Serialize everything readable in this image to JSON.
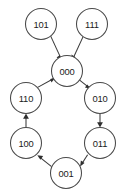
{
  "diagram": {
    "type": "directed-state-transition-graph",
    "width": 126,
    "height": 193,
    "background_color": "#ffffff",
    "node_stroke_color": "#4a4a4a",
    "node_fill_color": "#ffffff",
    "edge_color": "#3a3a3a",
    "label_color": "#1b1b1b",
    "node_radius": 15.5,
    "nodes": [
      {
        "id": "n101",
        "label": "101",
        "cx": 41,
        "cy": 24
      },
      {
        "id": "n111",
        "label": "111",
        "cx": 92,
        "cy": 24
      },
      {
        "id": "n000",
        "label": "000",
        "cx": 67,
        "cy": 71
      },
      {
        "id": "n110",
        "label": "110",
        "cx": 26,
        "cy": 98
      },
      {
        "id": "n010",
        "label": "010",
        "cx": 100,
        "cy": 98
      },
      {
        "id": "n100",
        "label": "100",
        "cx": 26,
        "cy": 143
      },
      {
        "id": "n011",
        "label": "011",
        "cx": 100,
        "cy": 143
      },
      {
        "id": "n001",
        "label": "001",
        "cx": 66,
        "cy": 173
      }
    ],
    "edges": [
      {
        "id": "e-101-000",
        "from": "101",
        "to": "000",
        "x1": 50.7,
        "y1": 36.1,
        "x2": 60.4,
        "y2": 57.2
      },
      {
        "id": "e-111-000",
        "from": "111",
        "to": "000",
        "x1": 83.1,
        "y1": 36.6,
        "x2": 73.6,
        "y2": 57.1
      },
      {
        "id": "e-000-010",
        "from": "000",
        "to": "010",
        "x1": 79.6,
        "y1": 80.2,
        "x2": 89.9,
        "y2": 88.4
      },
      {
        "id": "e-010-011",
        "from": "010",
        "to": "011",
        "x1": 100,
        "y1": 113.5,
        "x2": 100,
        "y2": 126.6
      },
      {
        "id": "e-011-001",
        "from": "011",
        "to": "001",
        "x1": 87.6,
        "y1": 154.8,
        "x2": 80.2,
        "y2": 165.9
      },
      {
        "id": "e-001-100",
        "from": "001",
        "to": "100",
        "x1": 51.6,
        "y1": 166.7,
        "x2": 37.8,
        "y2": 155.7
      },
      {
        "id": "e-100-110",
        "from": "100",
        "to": "110",
        "x1": 26,
        "y1": 127.5,
        "x2": 26,
        "y2": 114.6
      },
      {
        "id": "e-110-000",
        "from": "110",
        "to": "000",
        "x1": 37.2,
        "y1": 87.6,
        "x2": 54.6,
        "y2": 78.1
      }
    ]
  }
}
